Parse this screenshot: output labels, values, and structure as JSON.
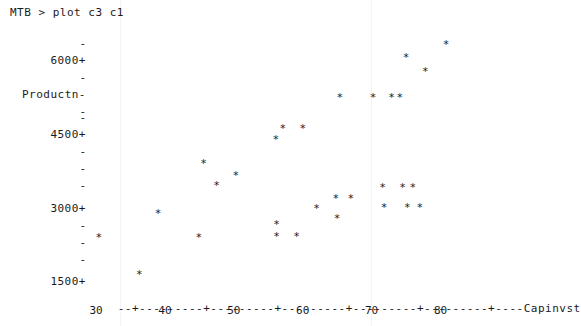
{
  "terminal": {
    "prompt_line": "MTB > plot c3 c1",
    "text_color": "#1a1a1a",
    "background_color": "#ffffff"
  },
  "chart_data": {
    "type": "scatter",
    "title": "",
    "xlabel": "Capinvst",
    "ylabel": "Productn",
    "marker": "*",
    "grid": false,
    "legend": null,
    "xlim": [
      26,
      84
    ],
    "ylim": [
      1400,
      6400
    ],
    "xticks": [
      30,
      40,
      50,
      60,
      70,
      80
    ],
    "xtick_labels": [
      "30",
      "40",
      "50",
      "60",
      "70",
      "80"
    ],
    "yticks": [
      1500,
      3000,
      4500,
      6000
    ],
    "ytick_labels": [
      "1500+",
      "3000+",
      "4500+",
      "6000+"
    ],
    "y_minor_tick_glyph": "-",
    "y_major_tick_glyph": "+",
    "axis_line": "--+---------+---------+---------+---------+---------+----",
    "points": [
      {
        "x": 30.4,
        "y": 2400
      },
      {
        "x": 36.3,
        "y": 1640
      },
      {
        "x": 39.0,
        "y": 2890
      },
      {
        "x": 44.9,
        "y": 2400
      },
      {
        "x": 47.5,
        "y": 3460
      },
      {
        "x": 45.6,
        "y": 3900
      },
      {
        "x": 50.3,
        "y": 3660
      },
      {
        "x": 56.2,
        "y": 2670
      },
      {
        "x": 56.2,
        "y": 2410
      },
      {
        "x": 59.1,
        "y": 2410
      },
      {
        "x": 56.1,
        "y": 4400
      },
      {
        "x": 57.1,
        "y": 4620
      },
      {
        "x": 60.0,
        "y": 4620
      },
      {
        "x": 62.0,
        "y": 2990
      },
      {
        "x": 64.8,
        "y": 3200
      },
      {
        "x": 67.0,
        "y": 3200
      },
      {
        "x": 65.0,
        "y": 2790
      },
      {
        "x": 65.4,
        "y": 5240
      },
      {
        "x": 70.2,
        "y": 5240
      },
      {
        "x": 72.9,
        "y": 5240
      },
      {
        "x": 74.1,
        "y": 5240
      },
      {
        "x": 71.6,
        "y": 3420
      },
      {
        "x": 74.5,
        "y": 3420
      },
      {
        "x": 76.0,
        "y": 3420
      },
      {
        "x": 71.8,
        "y": 3010
      },
      {
        "x": 75.2,
        "y": 3010
      },
      {
        "x": 77.0,
        "y": 3010
      },
      {
        "x": 75.0,
        "y": 6060
      },
      {
        "x": 77.8,
        "y": 5780
      },
      {
        "x": 80.8,
        "y": 6330
      }
    ]
  },
  "layout": {
    "y_axis_rows": [
      {
        "label": "",
        "glyph": "-",
        "top": 43
      },
      {
        "label": "6000+",
        "glyph": "",
        "top": 60
      },
      {
        "label": "",
        "glyph": "-",
        "top": 77
      },
      {
        "label": "Productn-",
        "glyph": "",
        "top": 94
      },
      {
        "label": "",
        "glyph": "-",
        "top": 111
      },
      {
        "label": "",
        "glyph": "-",
        "top": 117
      },
      {
        "label": "4500+",
        "glyph": "",
        "top": 134
      },
      {
        "label": "",
        "glyph": "-",
        "top": 151
      },
      {
        "label": "",
        "glyph": "-",
        "top": 168
      },
      {
        "label": "",
        "glyph": "-",
        "top": 185
      },
      {
        "label": "3000+",
        "glyph": "",
        "top": 208
      },
      {
        "label": "",
        "glyph": "-",
        "top": 225
      },
      {
        "label": "",
        "glyph": "-",
        "top": 242
      },
      {
        "label": "",
        "glyph": "-",
        "top": 259
      },
      {
        "label": "1500+",
        "glyph": "",
        "top": 281
      }
    ]
  }
}
